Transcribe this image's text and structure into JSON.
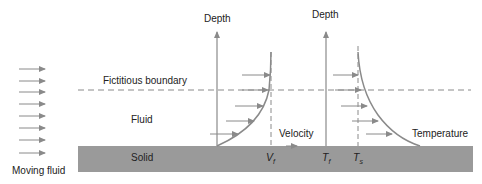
{
  "diagram": {
    "labels": {
      "depth_velocity_axis": "Depth",
      "depth_temperature_axis": "Depth",
      "fictitious_boundary": "Fictitious boundary",
      "fluid": "Fluid",
      "solid": "Solid",
      "moving_fluid": "Moving fluid",
      "velocity": "Velocity",
      "temperature": "Temperature",
      "v_f": "V",
      "v_f_sub": "f",
      "t_f": "T",
      "t_f_sub": "f",
      "t_s": "T",
      "t_s_sub": "s"
    },
    "colors": {
      "solid_fill": "#9a9a9a",
      "line": "#8a8a8a",
      "text": "#222222",
      "background": "#ffffff"
    },
    "moving_fluid_arrows": 8,
    "velocity_profile_arrows": 5,
    "temperature_profile_arrows": 5
  }
}
